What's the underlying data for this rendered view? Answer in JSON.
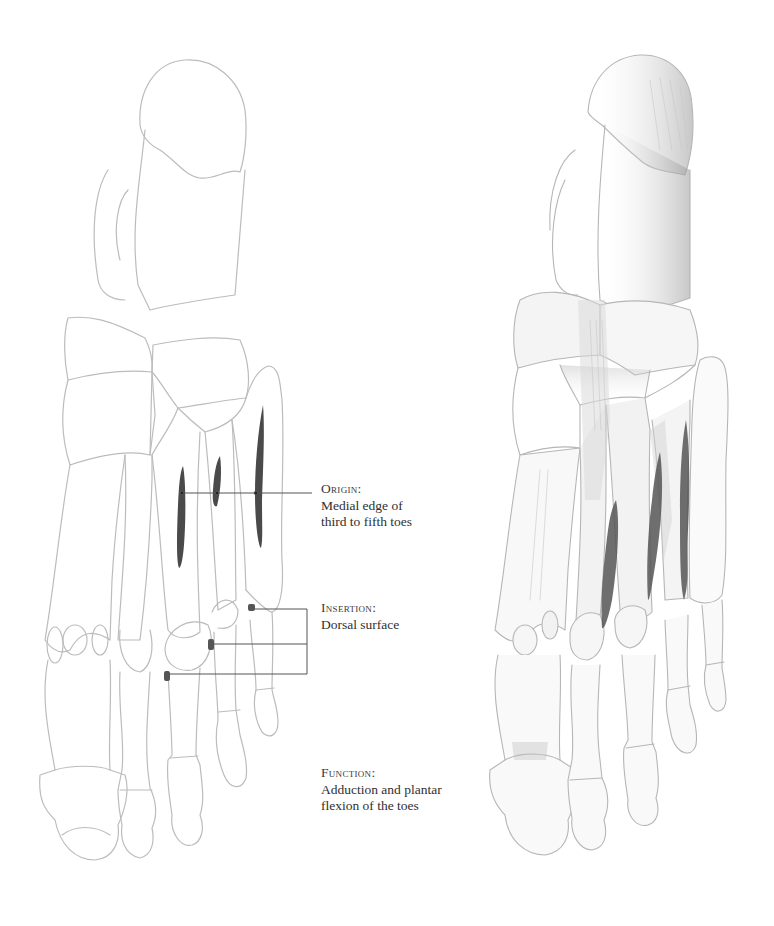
{
  "figure": {
    "left_drawing": "foot-skeleton-dorsal-outline",
    "right_drawing": "foot-skeleton-shaded-muscles",
    "colors": {
      "bone_line": "#b9b9b9",
      "shading": "#cfcfcf",
      "muscle_mark": "#4a4a4a",
      "leader_line": "#555555",
      "text": "#2f2f2f"
    }
  },
  "labels": {
    "origin": {
      "heading": "Origin:",
      "lines": [
        "Medial edge of",
        "third to fifth toes"
      ]
    },
    "insertion": {
      "heading": "Insertion:",
      "lines": [
        "Dorsal surface"
      ]
    },
    "function": {
      "heading": "Function:",
      "lines": [
        "Adduction and plantar",
        "flexion of the toes"
      ]
    }
  }
}
